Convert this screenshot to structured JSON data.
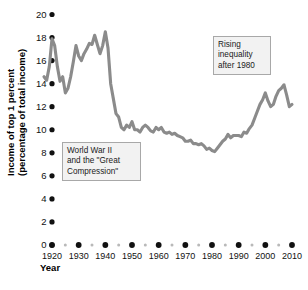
{
  "chart_data": {
    "type": "line",
    "title": "",
    "xlabel": "Year",
    "ylabel": "Income of top 1 percent (percentage of total income)",
    "ylabel_line1": "Income of top 1 percent",
    "ylabel_line2": "(percentage of total income)",
    "xlim": [
      1917,
      2012
    ],
    "ylim": [
      0,
      20
    ],
    "grid": false,
    "legend": null,
    "series_color": "#8b8b8b",
    "y_ticks": [
      0,
      2,
      4,
      6,
      8,
      10,
      12,
      14,
      16,
      18,
      20
    ],
    "y_tick_labels": [
      "0",
      "2",
      "4",
      "6",
      "8",
      "10",
      "12",
      "14",
      "16",
      "18",
      "20"
    ],
    "x_ticks": [
      1920,
      1930,
      1940,
      1950,
      1960,
      1970,
      1980,
      1990,
      2000,
      2010
    ],
    "x_tick_labels": [
      "1920",
      "1930",
      "1940",
      "1950",
      "1960",
      "1970",
      "1980",
      "1990",
      "2000",
      "2010"
    ],
    "x_minor_ticks": [
      1925,
      1935,
      1945,
      1955,
      1965,
      1975,
      1985,
      1995,
      2005
    ],
    "x": [
      1917,
      1918,
      1919,
      1920,
      1921,
      1922,
      1923,
      1924,
      1925,
      1926,
      1927,
      1928,
      1929,
      1930,
      1931,
      1932,
      1933,
      1934,
      1935,
      1936,
      1937,
      1938,
      1939,
      1940,
      1941,
      1942,
      1943,
      1944,
      1945,
      1946,
      1947,
      1948,
      1949,
      1950,
      1951,
      1952,
      1953,
      1954,
      1955,
      1956,
      1957,
      1958,
      1959,
      1960,
      1961,
      1962,
      1963,
      1964,
      1965,
      1966,
      1967,
      1968,
      1969,
      1970,
      1971,
      1972,
      1973,
      1974,
      1975,
      1976,
      1977,
      1978,
      1979,
      1980,
      1981,
      1982,
      1983,
      1984,
      1985,
      1986,
      1987,
      1988,
      1989,
      1990,
      1991,
      1992,
      1993,
      1994,
      1995,
      1996,
      1997,
      1998,
      1999,
      2000,
      2001,
      2002,
      2003,
      2004,
      2005,
      2006,
      2007,
      2008,
      2009,
      2010
    ],
    "y": [
      14.6,
      14.3,
      15.5,
      17.9,
      17.3,
      15.5,
      14.2,
      14.6,
      13.2,
      13.6,
      14.6,
      15.9,
      17.3,
      16.4,
      16.0,
      16.6,
      17.0,
      17.5,
      17.4,
      18.2,
      17.4,
      16.6,
      17.3,
      18.5,
      17.1,
      14.0,
      12.7,
      11.4,
      11.1,
      10.2,
      10.0,
      10.4,
      10.2,
      10.7,
      10.0,
      10.0,
      9.8,
      10.2,
      10.4,
      10.2,
      9.9,
      9.8,
      10.2,
      10.0,
      10.2,
      9.8,
      9.7,
      9.8,
      9.6,
      9.7,
      9.5,
      9.4,
      9.3,
      9.0,
      9.0,
      9.1,
      8.8,
      8.8,
      8.7,
      8.8,
      8.6,
      8.3,
      8.4,
      8.2,
      8.1,
      8.4,
      8.7,
      9.0,
      9.2,
      9.6,
      9.3,
      9.5,
      9.5,
      9.5,
      9.4,
      9.8,
      9.7,
      10.1,
      10.4,
      11.0,
      11.6,
      12.2,
      12.6,
      13.2,
      12.5,
      12.0,
      12.2,
      12.9,
      13.4,
      13.6,
      13.9,
      13.0,
      12.0,
      12.2
    ],
    "annotations": [
      {
        "name": "ww2-great-compression",
        "text": "World War II\nand the \"Great\nCompression\"",
        "lines": [
          "World War II",
          "and the \"Great",
          "Compression\""
        ]
      },
      {
        "name": "rising-inequality",
        "text": "Rising\ninequality\nafter 1980",
        "lines": [
          "Rising",
          "inequality",
          "after 1980"
        ]
      }
    ]
  }
}
